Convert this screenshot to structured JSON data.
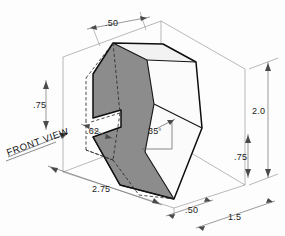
{
  "drawing": {
    "title": "Isometric pictorial of notched wedge block",
    "annotation": {
      "front_view_label": "FRONT VIEW"
    },
    "colors": {
      "shaded_face": "#8c8c8c",
      "light_face": "#fbfbfb",
      "object_edge": "#0d0d0d",
      "dimension_line": "#6f6f6f",
      "background": "#fdfdfd"
    },
    "dimensions": [
      {
        "id": "top-width",
        "label": ".50",
        "value": 0.5,
        "placement": "top"
      },
      {
        "id": "left-height",
        "label": ".75",
        "value": 0.75,
        "placement": "left"
      },
      {
        "id": "notch-depth",
        "label": ".62",
        "value": 0.62,
        "placement": "left-inner"
      },
      {
        "id": "angle",
        "label": "35",
        "value": 35,
        "placement": "center",
        "unit": "degree"
      },
      {
        "id": "bottom-length",
        "label": "2.75",
        "value": 2.75,
        "placement": "bottom-left"
      },
      {
        "id": "bottom-width",
        "label": ".50",
        "value": 0.5,
        "placement": "bottom-center"
      },
      {
        "id": "depth",
        "label": "1.5",
        "value": 1.5,
        "placement": "bottom-right"
      },
      {
        "id": "overall-height",
        "label": "2.0",
        "value": 2.0,
        "placement": "right"
      },
      {
        "id": "lower-height",
        "label": ".75",
        "value": 0.75,
        "placement": "right-inner"
      }
    ],
    "angle_symbol": "°"
  }
}
